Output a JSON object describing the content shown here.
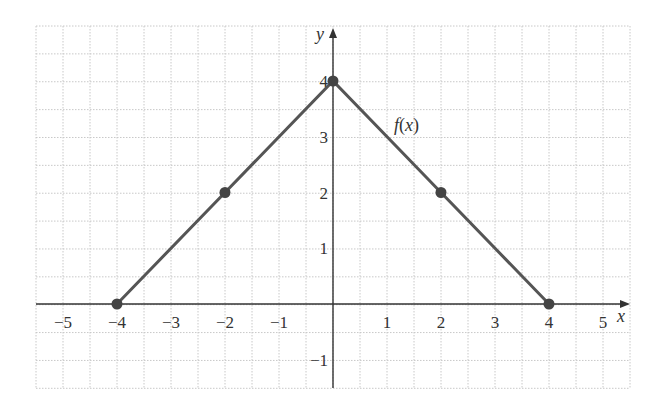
{
  "chart_data": {
    "type": "line",
    "title": "",
    "xlabel": "x",
    "ylabel": "y",
    "xlim": [
      -5.5,
      5.5
    ],
    "ylim": [
      -1.5,
      5
    ],
    "grid": true,
    "x_ticks": [
      -5,
      -4,
      -3,
      -2,
      -1,
      1,
      2,
      3,
      4,
      5
    ],
    "y_ticks": [
      -1,
      1,
      2,
      3,
      4
    ],
    "x_tick_labels": [
      "−5",
      "−4",
      "−3",
      "−2",
      "−1",
      "1",
      "2",
      "3",
      "4",
      "5"
    ],
    "y_tick_labels": [
      "−1",
      "1",
      "2",
      "3",
      "4"
    ],
    "series": [
      {
        "name": "f(x)",
        "x": [
          -4,
          -2,
          0,
          2,
          4
        ],
        "y": [
          0,
          2,
          4,
          2,
          0
        ],
        "color": "#555555",
        "markers": true
      }
    ],
    "annotations": [
      {
        "text": "f(x)",
        "x": 1.35,
        "y": 3.3
      }
    ]
  },
  "labels": {
    "x_axis": "x",
    "y_axis": "y",
    "function": "f(x)"
  },
  "colors": {
    "line": "#555555",
    "axis": "#333333",
    "grid": "#c8c8c8"
  }
}
